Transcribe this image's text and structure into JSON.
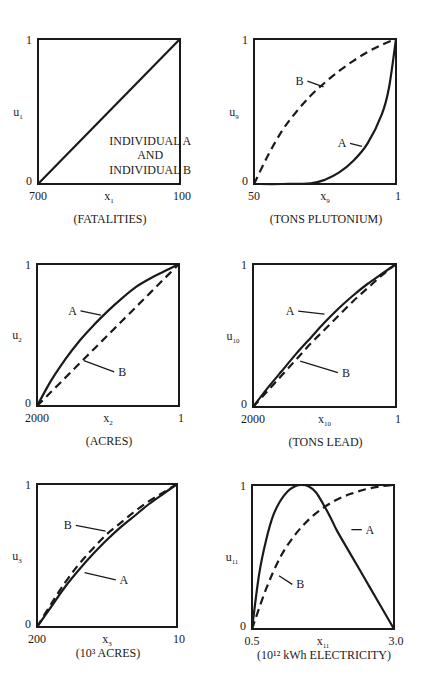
{
  "chart_data": [
    {
      "type": "line",
      "id": "u1",
      "ylabel": "u",
      "ylabel_sub": "1",
      "xlabel": "x",
      "xlabel_sub": "1",
      "unit_label": "(FATALITIES)",
      "x_ticks": [
        "700",
        "100"
      ],
      "y_ticks": [
        "0",
        "1"
      ],
      "ylim": [
        0,
        1
      ],
      "annotation": [
        "INDIVIDUAL A",
        "AND",
        "INDIVIDUAL B"
      ],
      "series": [
        {
          "name": "A and B",
          "style": "solid",
          "x": [
            0,
            1
          ],
          "y": [
            0,
            1
          ]
        }
      ]
    },
    {
      "type": "line",
      "id": "u9",
      "ylabel": "u",
      "ylabel_sub": "9",
      "xlabel": "x",
      "xlabel_sub": "9",
      "unit_label": "(TONS PLUTONIUM)",
      "x_ticks": [
        "50",
        "1"
      ],
      "y_ticks": [
        "0",
        "1"
      ],
      "ylim": [
        0,
        1
      ],
      "series": [
        {
          "name": "A",
          "style": "solid",
          "label_pos": [
            0.62,
            0.28
          ],
          "label_anchor": [
            0.76,
            0.26
          ],
          "x": [
            0,
            0.2,
            0.4,
            0.5,
            0.6,
            0.7,
            0.8,
            0.9,
            0.95,
            1.0
          ],
          "y": [
            0,
            0,
            0.005,
            0.03,
            0.08,
            0.16,
            0.28,
            0.48,
            0.66,
            1.0
          ]
        },
        {
          "name": "B",
          "style": "dashed",
          "label_pos": [
            0.32,
            0.71
          ],
          "label_anchor": [
            0.49,
            0.67
          ],
          "x": [
            0,
            0.1,
            0.2,
            0.3,
            0.4,
            0.5,
            0.6,
            0.7,
            0.8,
            0.9,
            1.0
          ],
          "y": [
            0,
            0.2,
            0.37,
            0.5,
            0.61,
            0.7,
            0.78,
            0.85,
            0.91,
            0.96,
            1.0
          ]
        }
      ]
    },
    {
      "type": "line",
      "id": "u2",
      "ylabel": "u",
      "ylabel_sub": "2",
      "xlabel": "x",
      "xlabel_sub": "2",
      "unit_label": "(ACRES)",
      "x_ticks": [
        "2000",
        "1"
      ],
      "y_ticks": [
        "0",
        "1"
      ],
      "ylim": [
        0,
        1
      ],
      "series": [
        {
          "name": "A",
          "style": "solid",
          "label_pos": [
            0.25,
            0.67
          ],
          "label_anchor": [
            0.45,
            0.64
          ],
          "x": [
            0,
            0.1,
            0.2,
            0.3,
            0.4,
            0.5,
            0.6,
            0.7,
            0.8,
            0.9,
            1.0
          ],
          "y": [
            0,
            0.18,
            0.33,
            0.46,
            0.57,
            0.67,
            0.76,
            0.84,
            0.9,
            0.95,
            1.0
          ]
        },
        {
          "name": "B",
          "style": "dashed",
          "label_pos": [
            0.6,
            0.24
          ],
          "label_anchor": [
            0.33,
            0.32
          ],
          "x": [
            0,
            0.1,
            0.2,
            0.3,
            0.4,
            0.5,
            0.6,
            0.7,
            0.8,
            0.9,
            1.0
          ],
          "y": [
            0,
            0.1,
            0.2,
            0.3,
            0.4,
            0.5,
            0.6,
            0.7,
            0.8,
            0.9,
            1.0
          ]
        }
      ]
    },
    {
      "type": "line",
      "id": "u10",
      "ylabel": "u",
      "ylabel_sub": "10",
      "xlabel": "x",
      "xlabel_sub": "10",
      "unit_label": "(TONS LEAD)",
      "x_ticks": [
        "2000",
        "1"
      ],
      "y_ticks": [
        "0",
        "1"
      ],
      "ylim": [
        0,
        1
      ],
      "series": [
        {
          "name": "A",
          "style": "solid",
          "label_pos": [
            0.26,
            0.67
          ],
          "label_anchor": [
            0.5,
            0.65
          ],
          "x": [
            0,
            0.1,
            0.2,
            0.3,
            0.4,
            0.5,
            0.6,
            0.7,
            0.8,
            0.9,
            1.0
          ],
          "y": [
            0,
            0.13,
            0.25,
            0.37,
            0.48,
            0.59,
            0.69,
            0.78,
            0.86,
            0.93,
            1.0
          ]
        },
        {
          "name": "B",
          "style": "dashed",
          "label_pos": [
            0.65,
            0.24
          ],
          "label_anchor": [
            0.33,
            0.32
          ],
          "x": [
            0,
            0.1,
            0.2,
            0.3,
            0.4,
            0.5,
            0.6,
            0.7,
            0.8,
            0.9,
            1.0
          ],
          "y": [
            0,
            0.11,
            0.22,
            0.33,
            0.44,
            0.54,
            0.64,
            0.74,
            0.83,
            0.92,
            1.0
          ]
        }
      ]
    },
    {
      "type": "line",
      "id": "u3",
      "ylabel": "u",
      "ylabel_sub": "3",
      "xlabel": "x",
      "xlabel_sub": "3",
      "unit_label": "(10³ ACRES)",
      "x_ticks": [
        "200",
        "10"
      ],
      "y_ticks": [
        "0",
        "1"
      ],
      "ylim": [
        0,
        1
      ],
      "series": [
        {
          "name": "A",
          "style": "solid",
          "label_pos": [
            0.62,
            0.33
          ],
          "label_anchor": [
            0.34,
            0.38
          ],
          "x": [
            0,
            0.1,
            0.2,
            0.3,
            0.4,
            0.5,
            0.6,
            0.7,
            0.8,
            0.9,
            1.0
          ],
          "y": [
            0,
            0.14,
            0.28,
            0.4,
            0.51,
            0.61,
            0.7,
            0.78,
            0.86,
            0.93,
            1.0
          ]
        },
        {
          "name": "B",
          "style": "dashed",
          "label_pos": [
            0.22,
            0.71
          ],
          "label_anchor": [
            0.49,
            0.67
          ],
          "x": [
            0,
            0.1,
            0.2,
            0.3,
            0.4,
            0.5,
            0.6,
            0.7,
            0.8,
            0.9,
            1.0
          ],
          "y": [
            0,
            0.16,
            0.31,
            0.44,
            0.55,
            0.65,
            0.73,
            0.81,
            0.88,
            0.94,
            1.0
          ]
        }
      ]
    },
    {
      "type": "line",
      "id": "u11",
      "ylabel": "u",
      "ylabel_sub": "11",
      "xlabel": "x",
      "xlabel_sub": "11",
      "unit_label": "(10¹² kWh ELECTRICITY)",
      "x_ticks": [
        "0.5",
        "3.0"
      ],
      "y_ticks": [
        "0",
        "1"
      ],
      "ylim": [
        0,
        1
      ],
      "series": [
        {
          "name": "A",
          "style": "solid",
          "label_pos": [
            0.83,
            0.69
          ],
          "label_anchor": [
            0.7,
            0.69
          ],
          "x": [
            0,
            0.05,
            0.1,
            0.15,
            0.2,
            0.25,
            0.3,
            0.35,
            0.4,
            0.45,
            0.5,
            0.55,
            0.6,
            0.7,
            0.8,
            0.9,
            1.0
          ],
          "y": [
            0,
            0.38,
            0.62,
            0.79,
            0.89,
            0.955,
            0.99,
            1.0,
            0.99,
            0.95,
            0.87,
            0.78,
            0.68,
            0.51,
            0.34,
            0.17,
            0.0
          ]
        },
        {
          "name": "B",
          "style": "dashed",
          "label_pos": [
            0.34,
            0.31
          ],
          "label_anchor": [
            0.19,
            0.37
          ],
          "x": [
            0,
            0.1,
            0.2,
            0.3,
            0.4,
            0.5,
            0.6,
            0.7,
            0.8,
            0.9,
            1.0
          ],
          "y": [
            0,
            0.28,
            0.5,
            0.65,
            0.76,
            0.84,
            0.9,
            0.94,
            0.97,
            0.99,
            1.0
          ]
        }
      ]
    }
  ],
  "layout": {
    "panels": [
      {
        "x": 38,
        "y": 39,
        "w": 142,
        "h": 145
      },
      {
        "x": 254,
        "y": 39,
        "w": 142,
        "h": 145
      },
      {
        "x": 37,
        "y": 264,
        "w": 142,
        "h": 142
      },
      {
        "x": 253,
        "y": 264,
        "w": 143,
        "h": 143
      },
      {
        "x": 37,
        "y": 484,
        "w": 140,
        "h": 143
      },
      {
        "x": 252,
        "y": 485,
        "w": 142,
        "h": 144
      }
    ]
  }
}
